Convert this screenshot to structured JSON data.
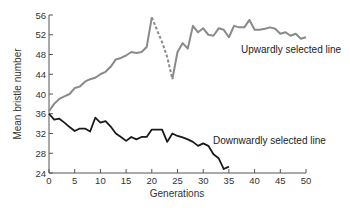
{
  "chart_data": {
    "type": "line",
    "title": "",
    "xlabel": "Generations",
    "ylabel": "Mean bristle number",
    "xlim": [
      0,
      50
    ],
    "ylim": [
      24,
      56
    ],
    "xticks": [
      0,
      5,
      10,
      15,
      20,
      25,
      30,
      35,
      40,
      45,
      50
    ],
    "yticks": [
      24,
      28,
      32,
      36,
      40,
      44,
      48,
      52,
      56
    ],
    "grid": false,
    "legend": "inline labels",
    "series": [
      {
        "name": "Upwardly selected line",
        "color": "#8a8a8a",
        "x": [
          0,
          1,
          2,
          3,
          4,
          5,
          6,
          7,
          8,
          9,
          10,
          11,
          12,
          13,
          14,
          15,
          16,
          17,
          18,
          19,
          20,
          21,
          22,
          23,
          24,
          25,
          26,
          27,
          28,
          29,
          30,
          31,
          32,
          33,
          34,
          35,
          36,
          37,
          38,
          39,
          40,
          41,
          42,
          43,
          44,
          45,
          46,
          47,
          48,
          49,
          50
        ],
        "values": [
          36.5,
          38,
          39,
          39.5,
          40,
          41.2,
          41.5,
          42.5,
          43,
          43.3,
          44,
          44.5,
          45.5,
          47,
          47.3,
          47.8,
          48.5,
          48.3,
          48.5,
          49.5,
          55.5,
          53,
          50.5,
          47.5,
          43,
          48.5,
          50.3,
          49.2,
          53.8,
          52.5,
          53.3,
          52,
          51.8,
          53.3,
          53,
          51.5,
          53.8,
          53.5,
          53.5,
          55,
          53,
          53,
          53.2,
          53.5,
          53.2,
          52.2,
          52.5,
          51.8,
          52.2,
          51.2,
          51.5
        ],
        "dashed_range": [
          20,
          24
        ]
      },
      {
        "name": "Downwardly selected line",
        "color": "#1a1a1a",
        "x": [
          0,
          1,
          2,
          3,
          4,
          5,
          6,
          7,
          8,
          9,
          10,
          11,
          12,
          13,
          14,
          15,
          16,
          17,
          18,
          19,
          20,
          21,
          22,
          23,
          24,
          25,
          26,
          27,
          28,
          29,
          30,
          31,
          32,
          33,
          34,
          35
        ],
        "values": [
          36,
          34.8,
          35,
          34.2,
          33.3,
          32.5,
          33,
          33,
          32.4,
          35.2,
          34.2,
          34.5,
          33.4,
          32,
          31.3,
          30.5,
          31.3,
          30.8,
          31.3,
          31.3,
          32.8,
          32.8,
          32.8,
          30.3,
          32,
          31.5,
          31.2,
          30.8,
          30.3,
          29.5,
          30,
          29.5,
          27.8,
          27,
          24.8,
          25.3
        ]
      }
    ],
    "annotations": [
      {
        "text": "Upwardly selected line",
        "near": "upper series, right end"
      },
      {
        "text": "Downwardly selected line",
        "near": "lower series, right end"
      }
    ]
  },
  "labels": {
    "xlabel": "Generations",
    "ylabel": "Mean bristle number",
    "upward": "Upwardly selected line",
    "downward": "Downwardly selected line"
  }
}
